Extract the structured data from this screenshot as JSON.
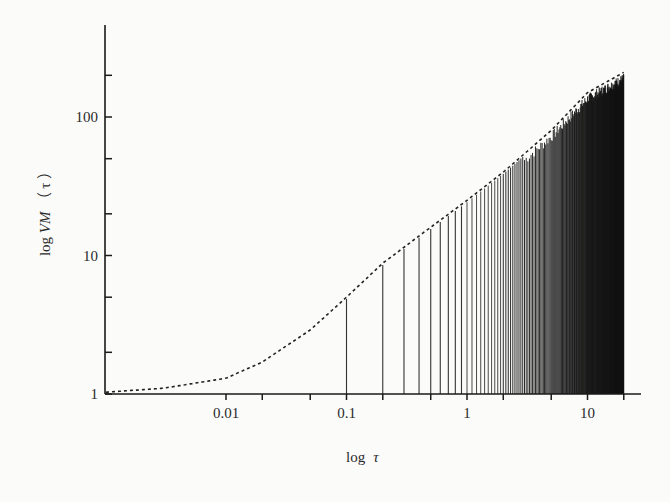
{
  "chart_data": {
    "type": "line",
    "title": "",
    "xlabel": "log τ",
    "ylabel": "log VM（τ）",
    "xscale": "log",
    "yscale": "log",
    "xlim": [
      0.001,
      25
    ],
    "ylim": [
      1,
      450
    ],
    "grid": false,
    "legend": null,
    "x_tick_labels": [
      "0.01",
      "0.1",
      "1",
      "10"
    ],
    "x_ticks": [
      0.01,
      0.02,
      0.05,
      0.1,
      0.2,
      0.5,
      1,
      2,
      5,
      10,
      20
    ],
    "y_tick_labels": [
      "1",
      "10",
      "100"
    ],
    "y_ticks": [
      1,
      2,
      5,
      10,
      20,
      50,
      100,
      200
    ],
    "series": [
      {
        "name": "envelope",
        "style": "dashed",
        "x": [
          0.001,
          0.003,
          0.01,
          0.02,
          0.05,
          0.1,
          0.2,
          0.5,
          1,
          2,
          5,
          10,
          20
        ],
        "values": [
          1.03,
          1.1,
          1.3,
          1.7,
          2.9,
          5,
          8.8,
          16,
          25,
          40,
          80,
          150,
          210
        ]
      },
      {
        "name": "spikes",
        "style": "vertical-lines",
        "x_start": 0.1,
        "x_step": 0.1,
        "x_end": 20,
        "sample_x": [
          0.1,
          0.2,
          0.3,
          0.4,
          0.5,
          1,
          2,
          5,
          10,
          20
        ],
        "sample_values": [
          5,
          8.8,
          12,
          14.5,
          16,
          25,
          40,
          80,
          140,
          200
        ]
      }
    ]
  },
  "axes": {
    "x_title_prefix": "log",
    "x_title_var": "τ",
    "y_title_prefix": "log ",
    "y_title_var": "VM",
    "y_title_paren": "（ τ ）"
  },
  "colors": {
    "axis": "#1a1a1a",
    "spike": "#111111",
    "envelope": "#222222",
    "background": "#fbfbfa"
  }
}
